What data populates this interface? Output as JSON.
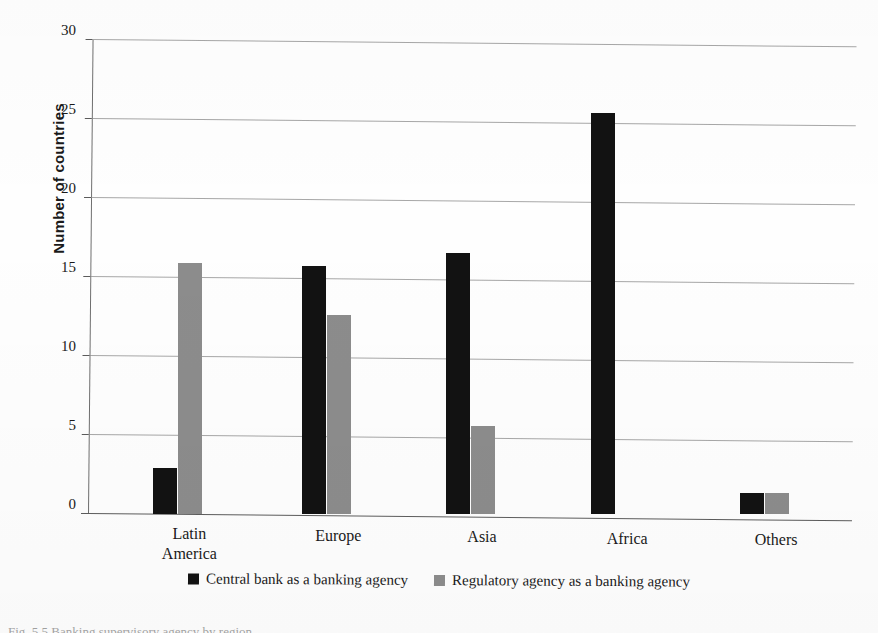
{
  "chart_data": {
    "type": "bar",
    "title": "",
    "subtitle": "",
    "xlabel": "",
    "ylabel": "Number of countries",
    "categories": [
      "Latin America",
      "Europe",
      "Asia",
      "Africa",
      "Others"
    ],
    "category_lines": [
      [
        "Latin",
        "America"
      ],
      [
        "Europe"
      ],
      [
        "Asia"
      ],
      [
        "Africa"
      ],
      [
        "Others"
      ]
    ],
    "series": [
      {
        "name": "Central bank as a banking agency",
        "color": "#121212",
        "values": [
          2.9,
          15.7,
          16.5,
          25.4,
          1.3
        ]
      },
      {
        "name": "Regulatory agency as a banking agency",
        "color": "#8c8c8c",
        "values": [
          15.9,
          12.6,
          5.6,
          0,
          1.3
        ]
      }
    ],
    "ylim": [
      0,
      30
    ],
    "yticks": [
      0,
      5,
      10,
      15,
      20,
      25,
      30
    ],
    "ytick_labels": [
      "0",
      "5",
      "10",
      "15",
      "20",
      "25",
      "30"
    ],
    "grid": true,
    "grid_axis": "y",
    "legend_position": "bottom-center"
  },
  "legend": {
    "items": [
      {
        "label": "Central bank as a banking agency",
        "color": "#121212"
      },
      {
        "label": "Regulatory agency as a banking agency",
        "color": "#8c8c8c"
      }
    ]
  },
  "caption": "Fig. 5.5 Banking supervisory agency by region"
}
